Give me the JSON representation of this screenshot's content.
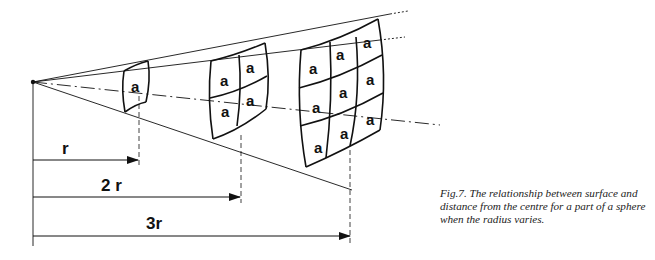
{
  "figure": {
    "caption": "Fig.7. The relationship between surface and distance from the centre for a part of a sphere when the radius varies.",
    "cell_label": "a",
    "distances": [
      {
        "label": "r",
        "multiple": 1,
        "cells": 1
      },
      {
        "label": "2 r",
        "multiple": 2,
        "cells": 4
      },
      {
        "label": "3r",
        "multiple": 3,
        "cells": 9
      }
    ],
    "line_color": "#111111",
    "background": "#ffffff"
  }
}
